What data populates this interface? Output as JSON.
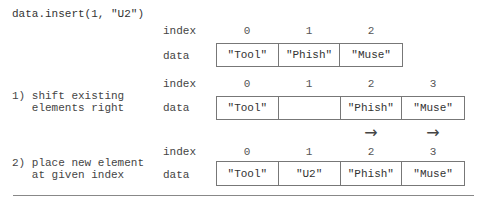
{
  "code": "data.insert(1, \"U2\")",
  "labels": {
    "index": "index",
    "data": "data"
  },
  "rows": [
    {
      "step": "",
      "indices": [
        "0",
        "1",
        "2"
      ],
      "cells": [
        "\"Tool\"",
        "\"Phish\"",
        "\"Muse\""
      ]
    },
    {
      "step_line1": "1) shift existing",
      "step_line2": "   elements right",
      "indices": [
        "0",
        "1",
        "2",
        "3"
      ],
      "cells": [
        "\"Tool\"",
        "",
        "\"Phish\"",
        "\"Muse\""
      ],
      "arrows": [
        "",
        "",
        "→",
        "→"
      ]
    },
    {
      "step_line1": "2) place new element",
      "step_line2": "   at given index",
      "indices": [
        "0",
        "1",
        "2",
        "3"
      ],
      "cells": [
        "\"Tool\"",
        "\"U2\"",
        "\"Phish\"",
        "\"Muse\""
      ]
    }
  ]
}
